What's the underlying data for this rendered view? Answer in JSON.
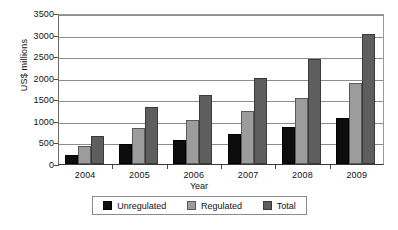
{
  "chart_data": {
    "type": "bar",
    "title": "",
    "xlabel": "Year",
    "ylabel": "US$ millions",
    "categories": [
      "2004",
      "2005",
      "2006",
      "2007",
      "2008",
      "2009"
    ],
    "series": [
      {
        "name": "Unregulated",
        "color": "#0d0d0d",
        "values": [
          220,
          470,
          560,
          690,
          860,
          1060
        ]
      },
      {
        "name": "Regulated",
        "color": "#9c9c9c",
        "values": [
          420,
          830,
          1010,
          1240,
          1520,
          1870
        ]
      },
      {
        "name": "Total",
        "color": "#5e5e5e",
        "values": [
          640,
          1310,
          1610,
          1990,
          2440,
          3020
        ]
      }
    ],
    "ylim": [
      0,
      3500
    ],
    "yticks": [
      0,
      500,
      1000,
      1500,
      2000,
      2500,
      3000,
      3500
    ],
    "ytick_labels": [
      "0",
      "500",
      "1000",
      "1500",
      "2000",
      "2500",
      "3000",
      "3500"
    ],
    "grid": true,
    "legend_position": "bottom"
  },
  "legend": {
    "items": [
      {
        "label": "Unregulated"
      },
      {
        "label": "Regulated"
      },
      {
        "label": "Total"
      }
    ]
  }
}
